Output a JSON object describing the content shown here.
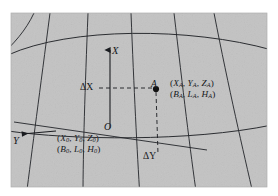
{
  "figure": {
    "background_color": "#ffffff",
    "plot_fill_color": "#c3c3c3",
    "line_color": "#1a1c20",
    "point_color": "#111111"
  },
  "axes": {
    "x_axis_label": "X",
    "y_axis_label": "Y",
    "origin_label": "O"
  },
  "point": {
    "label": "A",
    "coords_cartesian": "(XA, YA, ZA)",
    "coords_geodetic": "(BA, LA, HA)"
  },
  "origin": {
    "coords_cartesian": "(X0, Y0, Z0)",
    "coords_geodetic": "(B0, L0, H0)"
  },
  "offsets": {
    "delta_x_label": "ΔX",
    "delta_y_label": "ΔY"
  },
  "chart_data": {
    "type": "diagram",
    "graticule": {
      "meridian_count": 5,
      "parallel_count": 2,
      "curvature": "meridians converge upward, parallels arc upward"
    },
    "annotations": [
      {
        "name": "x-axis-arrow",
        "text": "X",
        "direction": "up",
        "x": 110,
        "y": 50
      },
      {
        "name": "y-axis-arrow",
        "text": "Y",
        "direction": "left",
        "x": 20,
        "y": 138
      },
      {
        "name": "origin",
        "text": "O",
        "x": 108,
        "y": 127
      },
      {
        "name": "point-a",
        "text": "A",
        "x": 156,
        "y": 88
      },
      {
        "name": "delta-x",
        "text": "ΔX",
        "x": 88,
        "y": 88
      },
      {
        "name": "delta-y",
        "text": "ΔY",
        "x": 150,
        "y": 157
      },
      {
        "name": "point-a-cartesian",
        "text": "(XA, YA, ZA)",
        "x": 172,
        "y": 84
      },
      {
        "name": "point-a-geodetic",
        "text": "(BA, LA, HA)",
        "x": 172,
        "y": 95
      },
      {
        "name": "origin-cartesian",
        "text": "(X0, Y0, Z0)",
        "x": 60,
        "y": 139
      },
      {
        "name": "origin-geodetic",
        "text": "(B0, L0, H0)",
        "x": 60,
        "y": 150
      }
    ]
  }
}
